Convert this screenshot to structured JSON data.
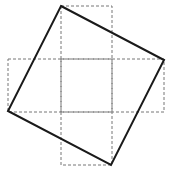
{
  "diagram": {
    "colors": {
      "background": "#ffffff",
      "dashed_grid": "#777777",
      "square": "#1a1a1a"
    },
    "grid_cells": [
      {
        "x": 61,
        "y": 6,
        "w": 51,
        "h": 53
      },
      {
        "x": 8,
        "y": 59,
        "w": 53,
        "h": 53
      },
      {
        "x": 61,
        "y": 59,
        "w": 51,
        "h": 53
      },
      {
        "x": 112,
        "y": 59,
        "w": 52,
        "h": 53
      },
      {
        "x": 61,
        "y": 112,
        "w": 51,
        "h": 53
      }
    ],
    "tilted_square_points": "61,6 164,60 111,165 8,111"
  }
}
